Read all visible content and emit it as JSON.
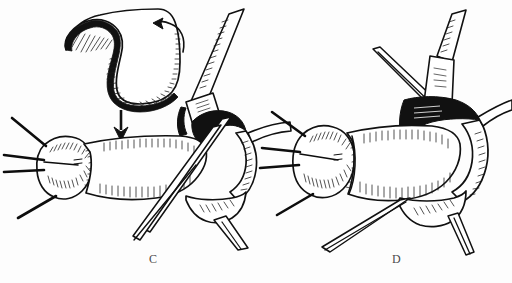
{
  "figure": {
    "style": "pen-and-ink line drawing",
    "background_color": "#fdfdfd",
    "ink_color": "#111111",
    "label_color": "#4a4a4a",
    "panels": [
      {
        "id": "C",
        "label": "C",
        "label_x": 155,
        "label_y": 260,
        "caption": "Tubular graft being rotated and brought down into position; curved rotation arrow at top right of the flap and a straight downward advancement arrow at center-left",
        "elements": [
          {
            "name": "curved-graft-flap",
            "description": "hooked tubular flap with heavy cross-hatched inner margin, upper left of panel"
          },
          {
            "name": "rotation-arrow",
            "description": "curved arrow at top right of flap pointing left and down"
          },
          {
            "name": "advancement-arrow",
            "description": "solid straight arrow pointing downward at panel center-left"
          },
          {
            "name": "graft-bulb-end",
            "description": "rounded stump end with radial stipple hatching at left"
          },
          {
            "name": "graft-body-tube",
            "description": "horizontal tubular conduit with longitudinal hatch shading"
          },
          {
            "name": "suture-strand",
            "description": "four long suture strands radiating from the bulb end"
          },
          {
            "name": "recipient-vessel",
            "description": "obliquely running recipient vessel at upper right with serrated hatched edge"
          },
          {
            "name": "vessel-clamp",
            "description": "small clamp / retractor band across the recipient vessel"
          },
          {
            "name": "open-lumen",
            "description": "solid black open lumen at the anastomotic site"
          },
          {
            "name": "retractor-blade",
            "description": "crossed retractor blades descending to lower center"
          }
        ]
      },
      {
        "id": "D",
        "label": "D",
        "label_x": 398,
        "label_y": 260,
        "caption": "Completed anastomosis with the graft seated in position; sutures placed and retractors holding the field open",
        "elements": [
          {
            "name": "graft-bulb-end",
            "description": "rounded stump end with radial stipple hatching at left"
          },
          {
            "name": "graft-body-tube",
            "description": "horizontal tubular conduit, seated, with longitudinal hatch shading"
          },
          {
            "name": "suture-strand",
            "description": "four suture strands radiating from the bulb end"
          },
          {
            "name": "recipient-vessel",
            "description": "recipient vessel at upper right with serrated hatched edge"
          },
          {
            "name": "vessel-clamp",
            "description": "clamp band across the upper vessel"
          },
          {
            "name": "anastomosis-lumen",
            "description": "dark shaded anastomotic junction at upper right of the graft"
          },
          {
            "name": "retractor-blade",
            "description": "retractor limbs descending at lower center and lower right"
          },
          {
            "name": "side-branch-vessel",
            "description": "small branch vessel running to the right margin"
          }
        ]
      }
    ]
  }
}
